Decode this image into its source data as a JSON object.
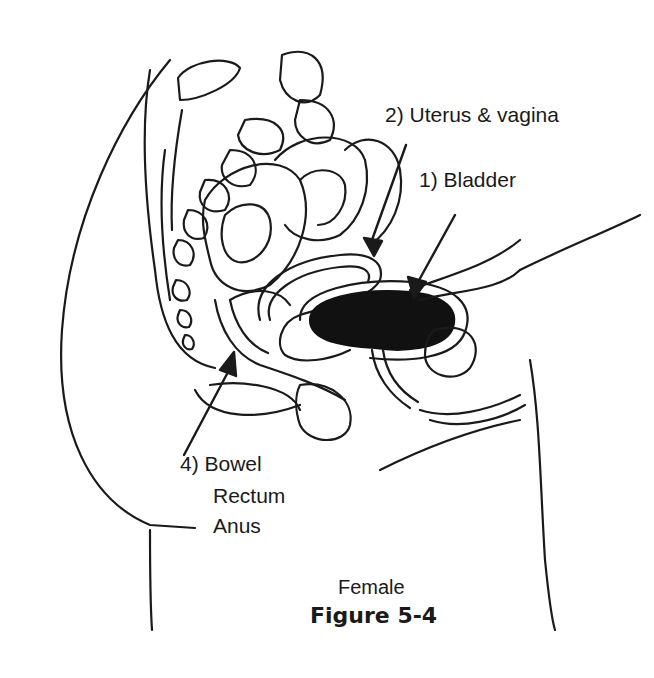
{
  "labels": {
    "uterus": "2) Uterus & vagina",
    "bladder": "1) Bladder",
    "bowel_line1": "4) Bowel",
    "bowel_line2": "Rectum",
    "bowel_line3": "Anus"
  },
  "caption": "Female",
  "figure_title": "Figure 5-4"
}
